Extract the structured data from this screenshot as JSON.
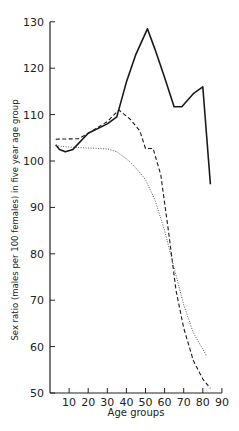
{
  "chart_data": {
    "type": "line",
    "title": "",
    "xlabel": "Age groups",
    "ylabel": "Sex ratio (males per 100 females) in five year age group",
    "xlim": [
      0,
      90
    ],
    "ylim": [
      50,
      130
    ],
    "x_ticks": [
      10,
      20,
      30,
      40,
      50,
      60,
      70,
      80,
      90
    ],
    "y_ticks": [
      50,
      60,
      70,
      80,
      90,
      100,
      110,
      120,
      130
    ],
    "grid": false,
    "legend": "none",
    "series": [
      {
        "name": "solid",
        "style": "solid",
        "points": [
          [
            3,
            103.5
          ],
          [
            5,
            102.5
          ],
          [
            8,
            102
          ],
          [
            12,
            102.5
          ],
          [
            20,
            106
          ],
          [
            30,
            108
          ],
          [
            35,
            109.5
          ],
          [
            40,
            117
          ],
          [
            45,
            123
          ],
          [
            51,
            128.5
          ],
          [
            55,
            124
          ],
          [
            60,
            118
          ],
          [
            65,
            111.7
          ],
          [
            69,
            111.7
          ],
          [
            75,
            114.5
          ],
          [
            80,
            116
          ],
          [
            84,
            95
          ]
        ]
      },
      {
        "name": "dashed",
        "style": "dashed",
        "points": [
          [
            3,
            104.7
          ],
          [
            15,
            104.8
          ],
          [
            20,
            106
          ],
          [
            30,
            108.5
          ],
          [
            36,
            111
          ],
          [
            42,
            109
          ],
          [
            47,
            106.5
          ],
          [
            50,
            102.7
          ],
          [
            54,
            102.7
          ],
          [
            58,
            97
          ],
          [
            62,
            85
          ],
          [
            66,
            72
          ],
          [
            70,
            64
          ],
          [
            75,
            57
          ],
          [
            80,
            53
          ],
          [
            84,
            51
          ]
        ]
      },
      {
        "name": "dotted",
        "style": "dotted",
        "points": [
          [
            3,
            103.3
          ],
          [
            10,
            103
          ],
          [
            20,
            102.8
          ],
          [
            30,
            102.6
          ],
          [
            35,
            102
          ],
          [
            40,
            100.5
          ],
          [
            45,
            98.5
          ],
          [
            50,
            96
          ],
          [
            55,
            91.5
          ],
          [
            60,
            85
          ],
          [
            65,
            77
          ],
          [
            70,
            69
          ],
          [
            75,
            63
          ],
          [
            82,
            58
          ]
        ]
      }
    ]
  }
}
